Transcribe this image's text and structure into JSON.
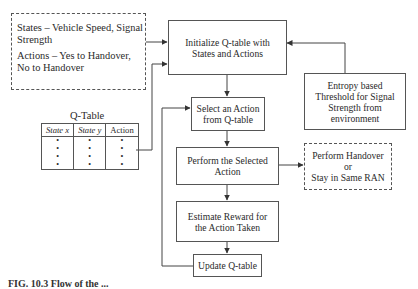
{
  "diagram": {
    "states_actions_note": {
      "states": "States – Vehicle Speed, Signal Strength",
      "actions": "Actions – Yes to Handover, No to Handover"
    },
    "q_table": {
      "title": "Q-Table",
      "headers": [
        "State x",
        "State y",
        "Action"
      ],
      "rows": [
        [
          "•",
          "•",
          "•"
        ],
        [
          "•",
          "•",
          "•"
        ],
        [
          "•",
          "•",
          "•"
        ],
        [
          "•",
          "•",
          "•"
        ]
      ]
    },
    "nodes": {
      "initialize": "Initialize Q-table with States and Actions",
      "entropy": "Entropy based Threshold for Signal Strength from environment",
      "select": "Select an Action from Q-table",
      "perform": "Perform the Selected Action",
      "outcome": "Perform Handover or Stay in Same RAN",
      "estimate": "Estimate Reward for the Action Taken",
      "update": "Update Q-table"
    },
    "outcome_lines": [
      "Perform Handover",
      "or",
      "Stay in Same RAN"
    ],
    "edges": [
      {
        "from": "states_actions_note",
        "to": "initialize"
      },
      {
        "from": "q_table",
        "to": "initialize"
      },
      {
        "from": "entropy",
        "to": "initialize"
      },
      {
        "from": "initialize",
        "to": "select"
      },
      {
        "from": "select",
        "to": "perform"
      },
      {
        "from": "perform",
        "to": "outcome"
      },
      {
        "from": "perform",
        "to": "estimate"
      },
      {
        "from": "estimate",
        "to": "update"
      },
      {
        "from": "update",
        "to": "select"
      }
    ],
    "caption": "FIG. 10.3   Flow of the ..."
  }
}
